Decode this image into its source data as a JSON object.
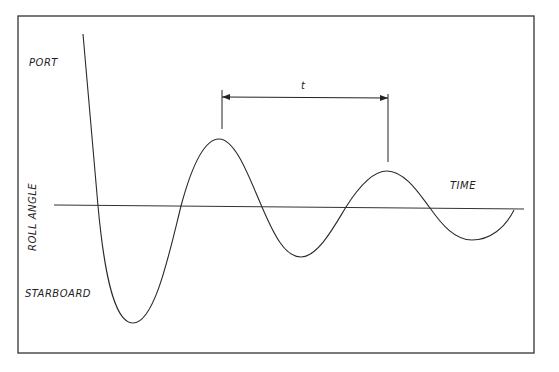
{
  "labels": {
    "port": "PORT",
    "starboard": "STARBOARD",
    "y_axis": "ROLL ANGLE",
    "x_axis": "TIME",
    "period": "t"
  },
  "colors": {
    "line": "#2a2a2a",
    "background": "#ffffff"
  },
  "curve": {
    "type": "damped oscillation",
    "start": [
      83,
      34
    ],
    "zero_crossings_x": [
      98,
      181,
      262,
      346,
      430,
      514
    ],
    "peaks": [
      [
        219,
        139
      ],
      [
        387,
        171
      ]
    ],
    "troughs": [
      [
        133,
        323
      ],
      [
        301,
        257
      ],
      [
        472,
        240
      ]
    ]
  },
  "dimension": {
    "from_x": 222,
    "to_x": 388,
    "y": 97
  }
}
